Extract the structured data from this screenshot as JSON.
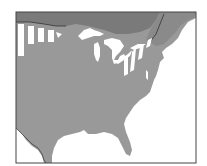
{
  "map": {
    "title": "",
    "region": "Eastern North America",
    "colors": {
      "background": "#ffffff",
      "range": "#999999",
      "canada_dark": "#7a7a7a",
      "canada_mid": "#8c8c8c",
      "water": "#ffffff",
      "border": "#333333",
      "frame": "#444444"
    },
    "legend": []
  }
}
